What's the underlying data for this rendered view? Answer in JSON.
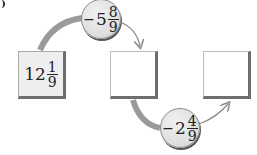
{
  "diagram": {
    "type": "arrow-chain",
    "boxes": [
      {
        "id": "start",
        "whole": "12",
        "numerator": "1",
        "denominator": "9",
        "filled": true
      },
      {
        "id": "middle",
        "whole": "",
        "numerator": "",
        "denominator": "",
        "filled": false
      },
      {
        "id": "end",
        "whole": "",
        "numerator": "",
        "denominator": "",
        "filled": false
      }
    ],
    "operations": [
      {
        "id": "op1",
        "sign": "−",
        "whole": "5",
        "numerator": "8",
        "denominator": "9",
        "from": "start",
        "to": "middle",
        "position": "top"
      },
      {
        "id": "op2",
        "sign": "−",
        "whole": "2",
        "numerator": "4",
        "denominator": "9",
        "from": "middle",
        "to": "end",
        "position": "bottom"
      }
    ],
    "colors": {
      "arc": "#9a9a9a",
      "box_border_dark": "#6e6e6e",
      "filled_box": "#eeeeee",
      "circle": "#dcdcdc"
    }
  }
}
